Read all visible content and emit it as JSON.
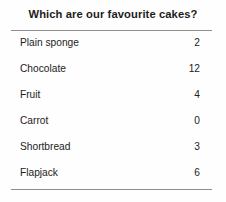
{
  "document": {
    "title": "Which are our favourite cakes?",
    "rule_color": "#8c8c8c",
    "background_color": "#fefefe",
    "text_color": "#222222"
  },
  "table": {
    "columns": [
      "Cake",
      "Votes"
    ],
    "rows": [
      {
        "label": "Plain sponge",
        "value": "2"
      },
      {
        "label": "Chocolate",
        "value": "12"
      },
      {
        "label": "Fruit",
        "value": "4"
      },
      {
        "label": "Carrot",
        "value": "0"
      },
      {
        "label": "Shortbread",
        "value": "3"
      },
      {
        "label": "Flapjack",
        "value": "6"
      }
    ]
  },
  "chart_data": {
    "type": "table",
    "title": "Which are our favourite cakes?",
    "categories": [
      "Plain sponge",
      "Chocolate",
      "Fruit",
      "Carrot",
      "Shortbread",
      "Flapjack"
    ],
    "values": [
      2,
      12,
      4,
      0,
      3,
      6
    ],
    "xlabel": "",
    "ylabel": "",
    "legend": []
  }
}
